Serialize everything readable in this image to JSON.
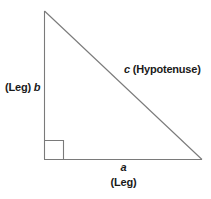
{
  "diagram": {
    "background_color": "#ffffff",
    "stroke_color": "#7a7a7a",
    "text_color": "#1a1a1a",
    "geometry": {
      "apex": [
        44,
        11
      ],
      "right_angle_vertex": [
        44,
        159
      ],
      "right_vertex": [
        202,
        159
      ],
      "right_angle_marker_size": 19
    },
    "labels": {
      "leg_b_prefix": "(Leg)",
      "leg_b_var": "b",
      "hypotenuse_var": "c",
      "hypotenuse_name": "(Hypotenuse)",
      "leg_a_var": "a",
      "leg_a_suffix": "(Leg)"
    }
  }
}
